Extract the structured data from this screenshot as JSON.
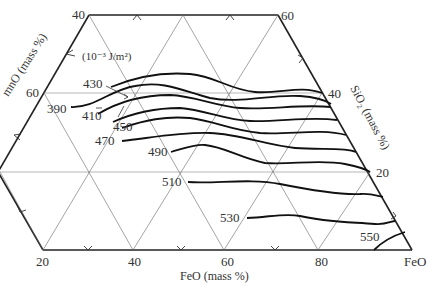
{
  "diagram": {
    "type": "ternary-contour",
    "unit_label": "(10⁻³ J/m²)",
    "axes": {
      "mno": {
        "title": "MnO (mass %)",
        "visible_title": "mnO (mass %)",
        "ticks": [
          "40",
          "60"
        ]
      },
      "sio2": {
        "title": "SiO₂ (mass %)",
        "ticks": [
          "60",
          "40",
          "20"
        ]
      },
      "feo": {
        "title": "FeO (mass %)",
        "ticks": [
          "20",
          "40",
          "60",
          "80"
        ],
        "corner": "FeO"
      }
    },
    "tick_labels": {
      "top_left": "40",
      "top_right": "60",
      "left_60": "60",
      "right_40": "40",
      "right_20": "20",
      "bottom_20": "20",
      "bottom_40": "40",
      "bottom_60": "60",
      "bottom_80": "80",
      "corner_feo": "FeO"
    },
    "contours": [
      {
        "label": "390",
        "value": 390
      },
      {
        "label": "410",
        "value": 410
      },
      {
        "label": "430",
        "value": 430
      },
      {
        "label": "450",
        "value": 450
      },
      {
        "label": "470",
        "value": 470
      },
      {
        "label": "490",
        "value": 490
      },
      {
        "label": "510",
        "value": 510
      },
      {
        "label": "530",
        "value": 530
      },
      {
        "label": "550",
        "value": 550
      }
    ]
  }
}
